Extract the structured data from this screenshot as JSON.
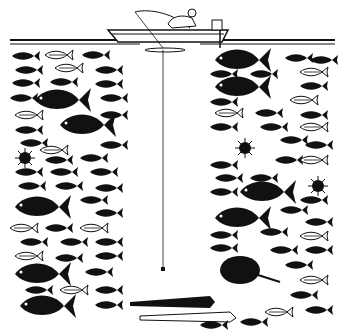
{
  "illustration": {
    "subject": "Fisherman in a boat above a deep water column full of fish, with a fishing line dropping straight down through an empty channel",
    "width": 343,
    "height": 336,
    "colors": {
      "ink": "#111111",
      "background": "#ffffff"
    },
    "elements": {
      "boat": {
        "x": 110,
        "y": 8,
        "w": 120,
        "h": 35
      },
      "water_surface_y": 40,
      "fishing_line": {
        "x": 163,
        "y1": 48,
        "y2": 268
      },
      "sinker": {
        "x": 163,
        "y": 270
      },
      "left_school": {
        "x1": 8,
        "x2": 128,
        "y1": 45,
        "y2": 320
      },
      "right_school": {
        "x1": 205,
        "x2": 335,
        "y1": 45,
        "y2": 320
      },
      "bottom_school": {
        "x1": 130,
        "x2": 300,
        "y1": 290,
        "y2": 330
      }
    }
  }
}
